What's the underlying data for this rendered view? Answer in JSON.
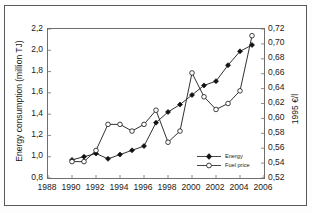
{
  "chart_data": {
    "type": "line",
    "title": "",
    "xlabel": "",
    "ylabel": "Energy consumption (million TJ)",
    "y2label": "1995 €/l",
    "x": [
      1990,
      1991,
      1992,
      1993,
      1994,
      1995,
      1996,
      1997,
      1998,
      1999,
      2000,
      2001,
      2002,
      2003,
      2004,
      2005
    ],
    "xlim": [
      1988,
      2006
    ],
    "xticks": [
      "1988",
      "1990",
      "1992",
      "1994",
      "1996",
      "1998",
      "2000",
      "2002",
      "2004",
      "2006"
    ],
    "xtick_values": [
      1988,
      1990,
      1992,
      1994,
      1996,
      1998,
      2000,
      2002,
      2004,
      2006
    ],
    "ylim": [
      0.8,
      2.2
    ],
    "yticks": [
      "0,8",
      "1,0",
      "1,2",
      "1,4",
      "1,6",
      "1,8",
      "2,0",
      "2,2"
    ],
    "ytick_values": [
      0.8,
      1.0,
      1.2,
      1.4,
      1.6,
      1.8,
      2.0,
      2.2
    ],
    "y2lim": [
      0.52,
      0.72
    ],
    "y2ticks": [
      "0,52",
      "0,54",
      "0,56",
      "0,58",
      "0,60",
      "0,62",
      "0,64",
      "0,66",
      "0,68",
      "0,70",
      "0,72"
    ],
    "y2tick_values": [
      0.52,
      0.54,
      0.56,
      0.58,
      0.6,
      0.62,
      0.64,
      0.66,
      0.68,
      0.7,
      0.72
    ],
    "grid": false,
    "legend_position": "bottom-right",
    "series": [
      {
        "name": "Energy",
        "axis": "left",
        "marker": "filled-diamond",
        "values": [
          0.97,
          1.0,
          1.03,
          0.98,
          1.02,
          1.06,
          1.1,
          1.32,
          1.42,
          1.49,
          1.58,
          1.67,
          1.71,
          1.86,
          1.99,
          2.05
        ]
      },
      {
        "name": "Fuel price",
        "axis": "right",
        "marker": "open-circle",
        "values": [
          0.542,
          0.542,
          0.557,
          0.592,
          0.592,
          0.583,
          0.592,
          0.611,
          0.568,
          0.583,
          0.661,
          0.629,
          0.612,
          0.62,
          0.637,
          0.711
        ]
      }
    ]
  },
  "legend": {
    "items": [
      {
        "label": "Energy"
      },
      {
        "label": "Fuel price"
      }
    ]
  },
  "axes": {
    "left_title": "Energy consumption (million TJ)",
    "right_title": "1995 €/l"
  },
  "colors": {
    "line": "#1a1a1a",
    "frame": "#6e6e6e",
    "background": "#ffffff"
  }
}
